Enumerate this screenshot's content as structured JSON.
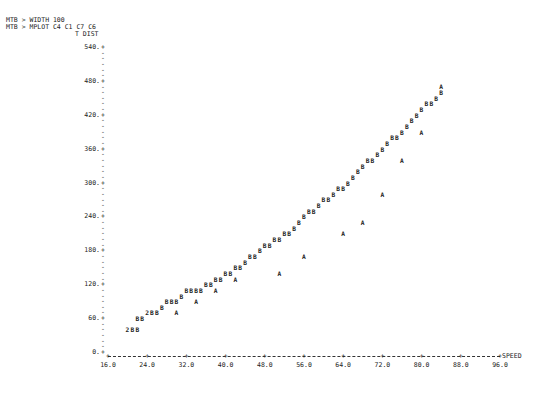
{
  "session": {
    "lines": [
      "MTB > WIDTH 100",
      "MTB > MPLOT C4 C1 C7 C6"
    ]
  },
  "chart_data": {
    "type": "scatter",
    "title": "",
    "xlabel": "SPEED",
    "ylabel": "T DIST",
    "xlim": [
      16.0,
      96.0
    ],
    "ylim": [
      0,
      540
    ],
    "x_ticks": [
      "16.0",
      "24.0",
      "32.0",
      "40.0",
      "48.0",
      "56.0",
      "64.0",
      "72.0",
      "80.0",
      "88.0",
      "96.0"
    ],
    "y_ticks": [
      "0.",
      "60.",
      "120.",
      "180.",
      "240.",
      "300.",
      "360.",
      "420.",
      "480.",
      "540."
    ],
    "grid": false,
    "legend": "A = first series, B = second series, 2 = overlapping points (MINITAB MPLOT symbols)",
    "series": [
      {
        "name": "A",
        "points": [
          [
            30,
            75
          ],
          [
            34,
            93
          ],
          [
            38,
            115
          ],
          [
            42,
            130
          ],
          [
            51,
            145
          ],
          [
            56,
            170
          ],
          [
            64,
            210
          ],
          [
            68,
            235
          ],
          [
            72,
            285
          ],
          [
            76,
            340
          ],
          [
            80,
            395
          ],
          [
            84,
            470
          ]
        ]
      },
      {
        "name": "B",
        "points": [
          [
            20,
            45
          ],
          [
            21,
            45
          ],
          [
            22,
            45
          ],
          [
            22,
            60
          ],
          [
            23,
            60
          ],
          [
            24,
            70
          ],
          [
            25,
            70
          ],
          [
            26,
            70
          ],
          [
            27,
            80
          ],
          [
            28,
            88
          ],
          [
            29,
            88
          ],
          [
            30,
            95
          ],
          [
            31,
            100
          ],
          [
            32,
            108
          ],
          [
            33,
            115
          ],
          [
            34,
            115
          ],
          [
            35,
            115
          ],
          [
            36,
            125
          ],
          [
            37,
            125
          ],
          [
            38,
            130
          ],
          [
            39,
            130
          ],
          [
            40,
            140
          ],
          [
            41,
            140
          ],
          [
            42,
            150
          ],
          [
            43,
            155
          ],
          [
            44,
            160
          ],
          [
            45,
            170
          ],
          [
            46,
            175
          ],
          [
            47,
            185
          ],
          [
            48,
            190
          ],
          [
            49,
            195
          ],
          [
            50,
            205
          ],
          [
            51,
            205
          ],
          [
            52,
            210
          ],
          [
            53,
            215
          ],
          [
            54,
            225
          ],
          [
            55,
            230
          ],
          [
            56,
            245
          ],
          [
            57,
            250
          ],
          [
            58,
            255
          ],
          [
            59,
            265
          ],
          [
            60,
            270
          ],
          [
            61,
            275
          ],
          [
            62,
            285
          ],
          [
            63,
            290
          ],
          [
            64,
            295
          ],
          [
            65,
            305
          ],
          [
            66,
            315
          ],
          [
            67,
            320
          ],
          [
            68,
            330
          ],
          [
            69,
            340
          ],
          [
            70,
            345
          ],
          [
            71,
            355
          ],
          [
            72,
            360
          ],
          [
            73,
            370
          ],
          [
            74,
            380
          ],
          [
            75,
            385
          ],
          [
            76,
            395
          ],
          [
            77,
            400
          ],
          [
            78,
            410
          ],
          [
            79,
            420
          ],
          [
            80,
            430
          ],
          [
            81,
            440
          ],
          [
            82,
            445
          ],
          [
            83,
            455
          ],
          [
            84,
            460
          ]
        ]
      },
      {
        "name": "2",
        "points": [
          [
            20,
            45
          ],
          [
            24,
            70
          ]
        ]
      }
    ]
  }
}
